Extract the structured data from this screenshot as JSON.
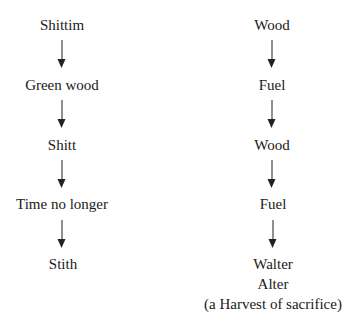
{
  "diagram": {
    "left_column": {
      "nodes": [
        "Shittim",
        "Green wood",
        "Shitt",
        "Time no longer",
        "Stith"
      ]
    },
    "right_column": {
      "nodes": [
        "Wood",
        "Fuel",
        "Wood",
        "Fuel",
        "Walter"
      ],
      "final_extra_lines": [
        "Alter",
        "(a Harvest of sacrifice)"
      ]
    },
    "edge_style": "downward arrow between consecutive nodes"
  }
}
